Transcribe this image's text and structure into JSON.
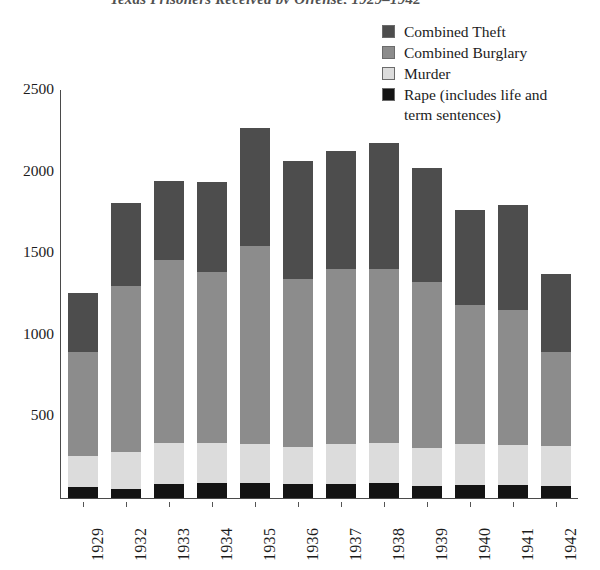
{
  "title": "Texas Prisoners Received by Offense, 1929–1942",
  "legend": {
    "position": "top-right",
    "items": [
      {
        "label": "Combined Theft",
        "key": "combined_theft",
        "color": "#4d4d4d"
      },
      {
        "label": "Combined Burglary",
        "key": "combined_burglary",
        "color": "#8c8c8c"
      },
      {
        "label": "Murder",
        "key": "murder",
        "color": "#dcdcdc"
      },
      {
        "label": "Rape (includes life and\nterm sentences)",
        "key": "rape",
        "color": "#141414"
      }
    ]
  },
  "axes": {
    "y": {
      "ticks": [
        "2500",
        "2000",
        "1500",
        "1000",
        "500"
      ],
      "tick_values": [
        2500,
        2000,
        1500,
        1000,
        500
      ],
      "min": 0,
      "max": 2500,
      "label": ""
    },
    "x": {
      "label": "",
      "categories": [
        "1929",
        "1932",
        "1933",
        "1934",
        "1935",
        "1936",
        "1937",
        "1938",
        "1939",
        "1940",
        "1941",
        "1942"
      ]
    }
  },
  "chart_data": {
    "type": "bar",
    "subtype": "stacked-vertical",
    "title": "Texas Prisoners Received by Offense, 1929–1942",
    "xlabel": "",
    "ylabel": "",
    "ylim": [
      0,
      2500
    ],
    "ytick_step": 500,
    "grid": false,
    "legend_position": "top-right",
    "stack_order_bottom_to_top": [
      "Rape (includes life and term sentences)",
      "Murder",
      "Combined Burglary",
      "Combined Theft"
    ],
    "categories": [
      "1929",
      "1932",
      "1933",
      "1934",
      "1935",
      "1936",
      "1937",
      "1938",
      "1939",
      "1940",
      "1941",
      "1942"
    ],
    "series": [
      {
        "name": "Rape (includes life and term sentences)",
        "color": "#141414",
        "values": [
          70,
          55,
          85,
          95,
          90,
          85,
          85,
          90,
          75,
          80,
          80,
          75
        ]
      },
      {
        "name": "Murder",
        "color": "#dcdcdc",
        "values": [
          185,
          230,
          255,
          245,
          240,
          230,
          245,
          250,
          230,
          250,
          245,
          245
        ]
      },
      {
        "name": "Combined Burglary",
        "color": "#8c8c8c",
        "values": [
          640,
          1015,
          1120,
          1045,
          1215,
          1030,
          1075,
          1065,
          1020,
          850,
          825,
          575
        ]
      },
      {
        "name": "Combined Theft",
        "color": "#4d4d4d",
        "values": [
          360,
          505,
          485,
          550,
          720,
          720,
          720,
          770,
          700,
          585,
          645,
          480
        ]
      }
    ],
    "totals": [
      1255,
      1805,
      1945,
      1935,
      2265,
      2065,
      2125,
      2175,
      2025,
      1765,
      1795,
      1375
    ]
  },
  "style": {
    "background": "#ffffff",
    "axis_color": "#4a4a4a",
    "text_color": "#1c1c1c"
  }
}
